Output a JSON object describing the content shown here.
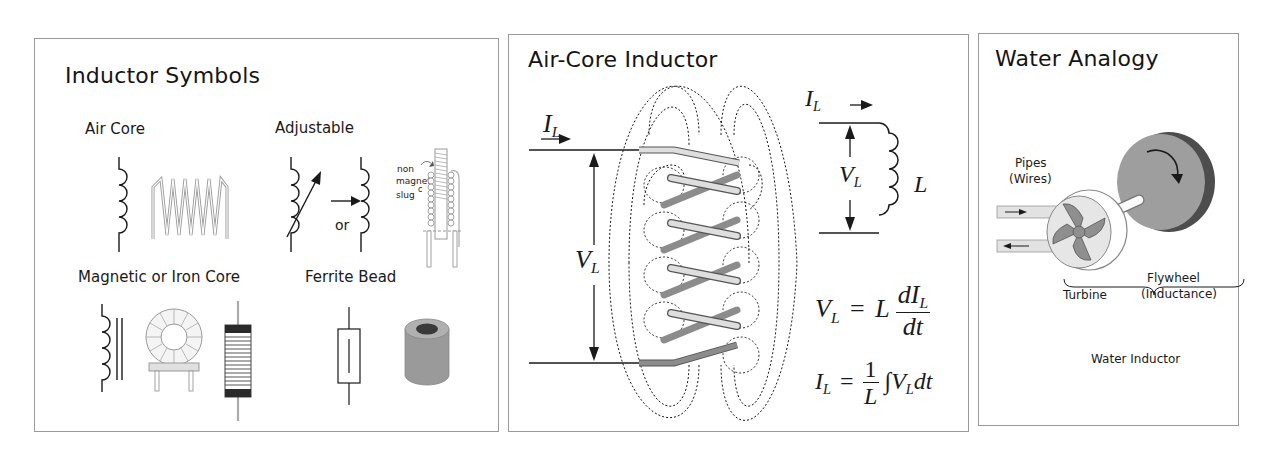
{
  "panels": [
    {
      "id": "inductor-symbols",
      "title": "Inductor Symbols",
      "sections": {
        "air_core": "Air Core",
        "adjustable": "Adjustable",
        "adjustable_or": "or",
        "slug_label": [
          "non",
          "magneti",
          "slug",
          "c"
        ],
        "iron_core": "Magnetic or Iron Core",
        "ferrite_bead": "Ferrite Bead"
      }
    },
    {
      "id": "air-core-inductor",
      "title": "Air-Core Inductor",
      "current_symbol": "I",
      "current_sub": "L",
      "voltage_symbol": "V",
      "voltage_sub": "L",
      "inductance_symbol": "L",
      "equation1": {
        "lhs": "V",
        "lhs_sub": "L",
        "eq": "=",
        "coef": "L",
        "num": "dI",
        "num_sub": "L",
        "den": "dt"
      },
      "equation2": {
        "lhs": "I",
        "lhs_sub": "L",
        "eq": "=",
        "num": "1",
        "den": "L",
        "integral": "∫",
        "body": "V",
        "body_sub": "L",
        "tail": "dt"
      }
    },
    {
      "id": "water-analogy",
      "title": "Water Analogy",
      "pipes_label": "Pipes",
      "pipes_sub": "(Wires)",
      "turbine_label": "Turbine",
      "flywheel_label": "Flywheel",
      "flywheel_sub": "(Inductance)",
      "bracket_label": "Water Inductor"
    }
  ],
  "colors": {
    "border": "#9a9a9a",
    "ink": "#1a1a1a",
    "coil_light": "#d9d9d9",
    "coil_dark": "#8c8c8c",
    "flywheel": "#9e9e9e",
    "flywheel_edge": "#4d4d4d"
  }
}
